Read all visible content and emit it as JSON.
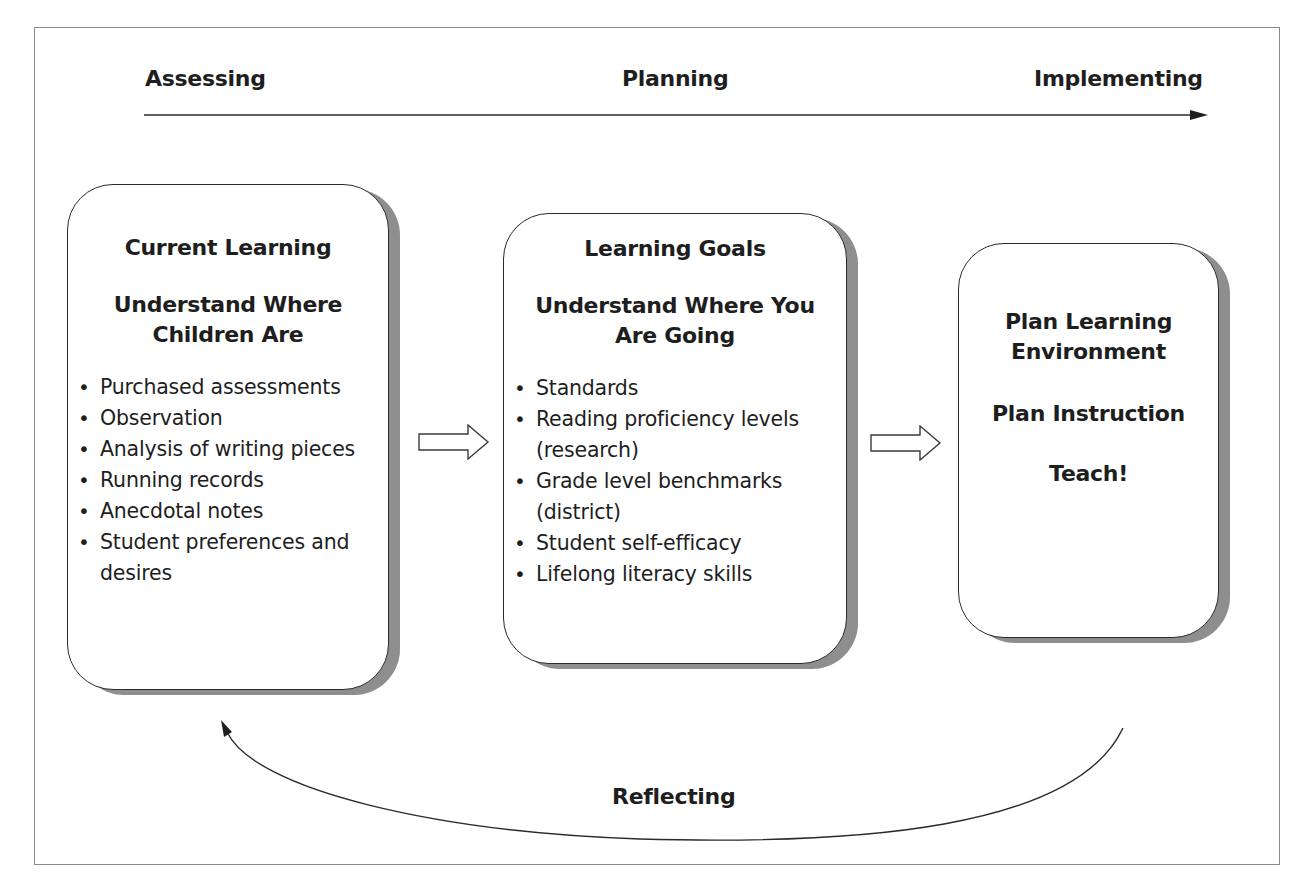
{
  "header": {
    "phases": [
      "Assessing",
      "Planning",
      "Implementing"
    ]
  },
  "boxes": [
    {
      "title": "Current Learning",
      "subtitle_lines": [
        "Understand Where",
        "Children Are"
      ],
      "items": [
        "Purchased assessments",
        "Observation",
        "Analysis of writing pieces",
        "Running records",
        "Anecdotal notes",
        "Student preferences and desires"
      ]
    },
    {
      "title": "Learning Goals",
      "subtitle_lines": [
        "Understand Where You",
        "Are Going"
      ],
      "items": [
        "Standards",
        "Reading proficiency levels (research)",
        "Grade level benchmarks (district)",
        "Student self-efficacy",
        "Lifelong literacy skills"
      ]
    },
    {
      "lines": [
        [
          "Plan Learning",
          "Environment"
        ],
        [
          "Plan Instruction"
        ],
        [
          "Teach!"
        ]
      ]
    }
  ],
  "cycle": {
    "label": "Reflecting"
  },
  "colors": {
    "text": "#1e1e1e",
    "border": "#2a2a2a",
    "shadow": "#8e8e8e",
    "frame": "#8a8a8a"
  }
}
